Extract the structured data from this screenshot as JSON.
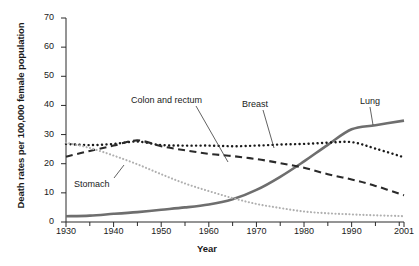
{
  "chart_data": {
    "type": "line",
    "title": "",
    "xlabel": "Year",
    "ylabel": "Death rates per 100,000 female population",
    "xlim": [
      1930,
      2001
    ],
    "ylim": [
      0,
      70
    ],
    "ytick_labels": [
      "0",
      "10",
      "20",
      "30",
      "40",
      "50",
      "60",
      "70"
    ],
    "ytick_values": [
      0,
      10,
      20,
      30,
      40,
      50,
      60,
      70
    ],
    "xtick_labels": [
      "1930",
      "1940",
      "1950",
      "1960",
      "1970",
      "1980",
      "1990",
      "2001"
    ],
    "xtick_values": [
      1930,
      1940,
      1950,
      1960,
      1970,
      1980,
      1990,
      2001
    ],
    "minor_xtick_values": [
      1935,
      1945,
      1955,
      1965,
      1975,
      1985,
      1995,
      2000
    ],
    "grid": false,
    "legend_position": "inline-annotations",
    "series": [
      {
        "name": "Lung",
        "style": "solid",
        "color": "#6e6e6e",
        "width": 2.6,
        "x": [
          1930,
          1935,
          1940,
          1945,
          1950,
          1955,
          1960,
          1965,
          1970,
          1975,
          1980,
          1985,
          1990,
          1995,
          2001
        ],
        "values": [
          2.0,
          2.2,
          2.8,
          3.4,
          4.2,
          5.0,
          6.0,
          7.8,
          11.0,
          15.5,
          20.8,
          26.5,
          31.8,
          33.2,
          34.8
        ]
      },
      {
        "name": "Breast",
        "style": "dotted",
        "color": "#1a1a1a",
        "width": 2.4,
        "x": [
          1930,
          1935,
          1940,
          1945,
          1950,
          1955,
          1960,
          1965,
          1970,
          1975,
          1980,
          1985,
          1990,
          1995,
          2001
        ],
        "values": [
          26.8,
          26.4,
          26.8,
          27.6,
          26.4,
          26.2,
          26.2,
          26.0,
          26.2,
          26.6,
          26.8,
          27.2,
          27.4,
          25.2,
          22.2
        ]
      },
      {
        "name": "Colon and rectum",
        "style": "dashed",
        "color": "#2a2a2a",
        "width": 2.1,
        "x": [
          1930,
          1935,
          1940,
          1945,
          1950,
          1955,
          1960,
          1965,
          1970,
          1975,
          1980,
          1985,
          1990,
          1995,
          2001
        ],
        "values": [
          22.4,
          24.4,
          26.2,
          28.0,
          26.0,
          24.6,
          23.4,
          22.6,
          21.6,
          20.2,
          18.6,
          16.4,
          14.6,
          12.4,
          9.2
        ]
      },
      {
        "name": "Stomach",
        "style": "dotted-light",
        "color": "#b0b0b0",
        "width": 2.1,
        "x": [
          1930,
          1935,
          1940,
          1945,
          1950,
          1955,
          1960,
          1965,
          1970,
          1975,
          1980,
          1985,
          1990,
          1995,
          2001
        ],
        "values": [
          27.2,
          25.4,
          22.8,
          19.8,
          16.4,
          13.2,
          10.6,
          8.2,
          6.2,
          4.8,
          3.6,
          3.0,
          2.6,
          2.3,
          2.0
        ]
      }
    ],
    "annotations": [
      {
        "label": "Colon and rectum",
        "label_x": 131,
        "label_y": 95,
        "leader": [
          196,
          106,
          228,
          162
        ]
      },
      {
        "label": "Breast",
        "label_x": 242,
        "label_y": 99,
        "leader": [
          263,
          110,
          274,
          148
        ]
      },
      {
        "label": "Lung",
        "label_x": 360,
        "label_y": 96,
        "leader": [
          370,
          107,
          373,
          125
        ]
      },
      {
        "label": "Stomach",
        "label_x": 74,
        "label_y": 179,
        "leader": [
          114,
          178,
          124,
          165
        ]
      }
    ]
  }
}
